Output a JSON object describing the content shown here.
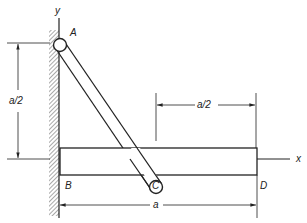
{
  "diagram": {
    "labels": {
      "y_axis": "y",
      "x_axis": "x",
      "point_a": "A",
      "point_b": "B",
      "point_c": "C",
      "point_d": "D"
    },
    "dimensions": {
      "left_vertical": "a/2",
      "top_horizontal": "a/2",
      "bottom_horizontal": "a"
    },
    "colors": {
      "line": "#222222",
      "background": "#ffffff"
    }
  }
}
